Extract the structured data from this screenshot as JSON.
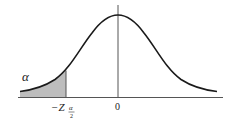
{
  "diagram": {
    "type": "normal-distribution-left-tail",
    "curve_color": "#1a1a1a",
    "shade_color": "#bdbdbd",
    "axis_color": "#555555",
    "labels": {
      "alpha": "α",
      "critical_value": "−Z",
      "critical_subscript_num": "α",
      "critical_subscript_den": "2",
      "center": "0"
    }
  }
}
